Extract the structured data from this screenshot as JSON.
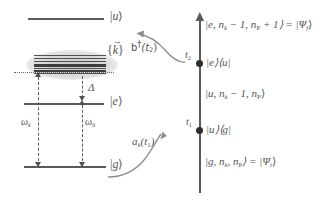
{
  "figure": {
    "kind": "physics-energy-level-and-time-ladder-diagram",
    "left_panel": {
      "title": "three-level atom energy diagram",
      "levels": [
        {
          "id": "u",
          "label_bar": "|",
          "label_sym": "u",
          "label_ket": "⟩",
          "y": 18
        },
        {
          "id": "e",
          "label_bar": "|",
          "label_sym": "e",
          "label_ket": "⟩",
          "y": 103
        },
        {
          "id": "g",
          "label_bar": "|",
          "label_sym": "g",
          "label_ket": "⟩",
          "y": 166
        }
      ],
      "continuum_label": {
        "open": "{",
        "sym": "k",
        "vec": "→",
        "close": "}"
      },
      "detuning_label": "Δ",
      "transition_left": {
        "sym": "ω",
        "sub": "k"
      },
      "transition_right": {
        "sym": "ω",
        "sub": "0"
      }
    },
    "right_panel": {
      "title": "time-ordered interaction ladder",
      "time_axis_direction": "upward",
      "entries": [
        {
          "id": "final-state",
          "text": "|e, n",
          "sub1": "k",
          "text2": " − 1, n",
          "sub2": "P",
          "text3": " + 1⟩ = |Ψ",
          "sub3": "f",
          "text4": "⟩"
        },
        {
          "id": "operator-t2",
          "time_label_sym": "t",
          "time_label_sub": "2",
          "text": "|e⟩⟨u|"
        },
        {
          "id": "intermediate-state",
          "text": "|u, n",
          "sub1": "k",
          "text2": " − 1, n",
          "sub2": "P",
          "text3": "⟩"
        },
        {
          "id": "operator-t1",
          "time_label_sym": "t",
          "time_label_sub": "1",
          "text": "|u⟩⟨g|"
        },
        {
          "id": "initial-state",
          "text": "|g, n",
          "sub1": "k",
          "text2": ", n",
          "sub2": "P",
          "text3": "⟩ = |Ψ",
          "sub3": "i",
          "text4": "⟩"
        }
      ],
      "arrow_labels": [
        {
          "id": "creation-operator",
          "sym": "b",
          "dagger": "†",
          "args": "(t",
          "args_sub": "2",
          "args_close": ")"
        },
        {
          "id": "annihilation-operator",
          "sym": "a",
          "sub": "k",
          "args": "(t",
          "args_sub": "1",
          "args_close": ")"
        }
      ]
    },
    "colors": {
      "line": "#5a5a5a",
      "node": "#2e2e2e",
      "text": "#555555",
      "blob": "#d6d6d6",
      "background": "#ffffff"
    }
  }
}
